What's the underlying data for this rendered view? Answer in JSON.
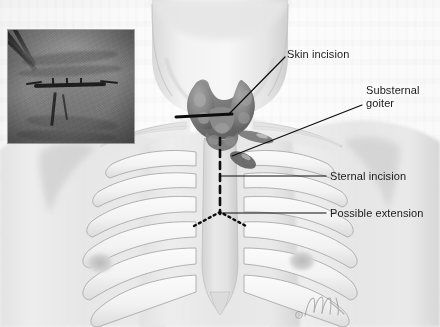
{
  "figure": {
    "width": 440,
    "height": 327,
    "background_color": "#fdfdfd"
  },
  "labels": {
    "skin_incision": "Skin incision",
    "substernal_goiter_line1": "Substernal",
    "substernal_goiter_line2": "goiter",
    "sternal_incision": "Sternal incision",
    "possible_extension": "Possible extension"
  },
  "markings": {
    "skin_incision_style": "solid-thick-black",
    "sternal_incision_style": "dashed-black",
    "possible_extension_style": "dotted-black",
    "leader_line_style": "solid-thin-black",
    "line_color": "#0d0d0d"
  },
  "inset": {
    "name": "clinical-photograph-neck-scar",
    "caption": "",
    "x": 8,
    "y": 30,
    "width": 126,
    "height": 113,
    "tone": "grayscale"
  },
  "anatomy_parts": [
    "neck",
    "chin-shadow",
    "clavicle-left",
    "clavicle-right",
    "shoulder-left",
    "shoulder-right",
    "thyroid-gland-goiter",
    "sternum",
    "rib-cage",
    "nipple-left",
    "nipple-right"
  ],
  "colors": {
    "skin_light": "#f0f0f0",
    "skin_mid": "#d8d8d8",
    "skin_shadow": "#bcbcbc",
    "rib_light": "#f6f6f6",
    "rib_edge": "#a9a9a9",
    "goiter_dark": "#6f6f6f",
    "goiter_mid": "#909090",
    "ink": "#0d0d0d",
    "text": "#1a1a1a"
  },
  "credit": {
    "symbol": "©",
    "artist_signature": "artist-signature-mark"
  }
}
